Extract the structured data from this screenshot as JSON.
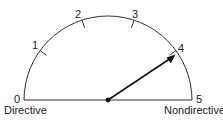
{
  "gauge": {
    "scale_min": 0,
    "scale_max": 5,
    "tick_labels": [
      "0",
      "1",
      "2",
      "3",
      "4",
      "5"
    ],
    "pointer_value": 4,
    "left_label": "Directive",
    "right_label": "Nondirective"
  }
}
